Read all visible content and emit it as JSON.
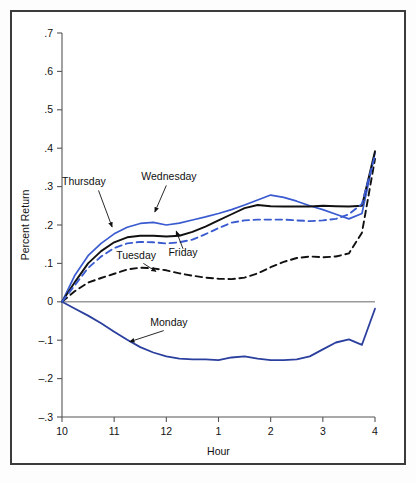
{
  "figure": {
    "background": "#ffffff",
    "frame_color": "#3b3b3b"
  },
  "chart_data": {
    "type": "line",
    "title": "",
    "subtitle": "",
    "xlabel": "Hour",
    "ylabel": "Percent Return",
    "grid": false,
    "legend_position": "inline-annotations",
    "x": [
      10,
      10.25,
      10.5,
      10.75,
      11,
      11.25,
      11.5,
      11.75,
      12,
      12.25,
      12.5,
      12.75,
      13,
      13.25,
      13.5,
      13.75,
      14,
      14.25,
      14.5,
      14.75,
      15,
      15.25,
      15.5,
      15.75,
      16
    ],
    "x_tick_values": [
      10,
      11,
      12,
      13,
      14,
      15,
      16
    ],
    "x_tick_labels": [
      "10",
      "11",
      "12",
      "1",
      "2",
      "3",
      "4"
    ],
    "xlim": [
      10,
      16
    ],
    "y_tick_values": [
      0.7,
      0.6,
      0.5,
      0.4,
      0.3,
      0.2,
      0.1,
      0,
      -0.1,
      -0.2,
      -0.3
    ],
    "y_tick_labels": [
      ".7",
      ".6",
      ".5",
      ".4",
      ".3",
      ".2",
      ".1",
      "0",
      "–.1",
      "–.2",
      "–.3"
    ],
    "ylim": [
      -0.3,
      0.7
    ],
    "series": [
      {
        "name": "Monday",
        "color": "#2b3f9e",
        "style": "solid",
        "width": 1.8,
        "label_x": 12.05,
        "label_y": -0.062,
        "arrow_from_x": 11.95,
        "arrow_from_y": -0.075,
        "arrow_to_x": 11.3,
        "arrow_to_y": -0.104,
        "values": [
          0.0,
          -0.018,
          -0.036,
          -0.056,
          -0.078,
          -0.099,
          -0.118,
          -0.132,
          -0.142,
          -0.148,
          -0.15,
          -0.15,
          -0.152,
          -0.145,
          -0.142,
          -0.148,
          -0.152,
          -0.152,
          -0.15,
          -0.142,
          -0.124,
          -0.106,
          -0.098,
          -0.112,
          -0.018
        ]
      },
      {
        "name": "Tuesday",
        "color": "#111111",
        "style": "dashed",
        "width": 1.9,
        "label_x": 11.42,
        "label_y": 0.112,
        "arrow_from_x": 11.56,
        "arrow_from_y": 0.1,
        "arrow_to_x": 11.8,
        "arrow_to_y": 0.079,
        "values": [
          0.0,
          0.028,
          0.05,
          0.062,
          0.073,
          0.084,
          0.089,
          0.087,
          0.082,
          0.074,
          0.068,
          0.063,
          0.06,
          0.059,
          0.063,
          0.074,
          0.09,
          0.104,
          0.114,
          0.118,
          0.116,
          0.118,
          0.126,
          0.18,
          0.372
        ]
      },
      {
        "name": "Wednesday",
        "color": "#3a5bd0",
        "style": "solid",
        "width": 1.7,
        "label_x": 12.05,
        "label_y": 0.318,
        "arrow_from_x": 12.0,
        "arrow_from_y": 0.303,
        "arrow_to_x": 11.78,
        "arrow_to_y": 0.234,
        "values": [
          0.0,
          0.07,
          0.12,
          0.152,
          0.177,
          0.194,
          0.204,
          0.207,
          0.2,
          0.205,
          0.213,
          0.221,
          0.23,
          0.24,
          0.252,
          0.265,
          0.278,
          0.272,
          0.262,
          0.25,
          0.24,
          0.228,
          0.216,
          0.23,
          0.388
        ]
      },
      {
        "name": "Thursday",
        "color": "#111111",
        "style": "solid",
        "width": 1.9,
        "label_x": 10.42,
        "label_y": 0.305,
        "arrow_from_x": 10.7,
        "arrow_from_y": 0.29,
        "arrow_to_x": 10.96,
        "arrow_to_y": 0.195,
        "values": [
          0.0,
          0.052,
          0.1,
          0.132,
          0.155,
          0.168,
          0.172,
          0.172,
          0.17,
          0.172,
          0.182,
          0.196,
          0.212,
          0.228,
          0.244,
          0.252,
          0.249,
          0.248,
          0.248,
          0.248,
          0.25,
          0.249,
          0.248,
          0.25,
          0.392
        ]
      },
      {
        "name": "Friday",
        "color": "#3a5bd0",
        "style": "dashed",
        "width": 1.9,
        "label_x": 12.32,
        "label_y": 0.118,
        "arrow_from_x": 12.32,
        "arrow_from_y": 0.138,
        "arrow_to_x": 12.19,
        "arrow_to_y": 0.184,
        "values": [
          0.0,
          0.044,
          0.088,
          0.118,
          0.14,
          0.152,
          0.156,
          0.155,
          0.152,
          0.155,
          0.162,
          0.176,
          0.192,
          0.206,
          0.212,
          0.214,
          0.214,
          0.214,
          0.212,
          0.21,
          0.212,
          0.216,
          0.228,
          0.255,
          0.382
        ]
      }
    ]
  }
}
